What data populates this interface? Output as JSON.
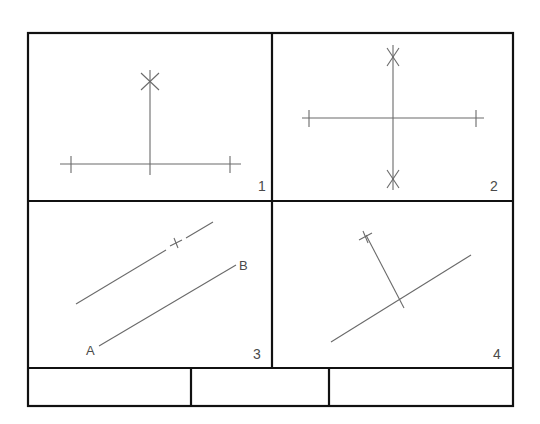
{
  "sheet": {
    "title": "Geometric construction exercises",
    "panels": [
      {
        "number": "1",
        "description": "Perpendicular erected at midpoint of horizontal line"
      },
      {
        "number": "2",
        "description": "Perpendicular bisector of horizontal line"
      },
      {
        "number": "3",
        "description": "Line parallel to AB",
        "labels": {
          "a": "A",
          "b": "B"
        }
      },
      {
        "number": "4",
        "description": "Perpendicular to an inclined line"
      }
    ],
    "title_block": {
      "cells": [
        "",
        "",
        ""
      ]
    }
  },
  "colors": {
    "frame": "#111111",
    "construction": "#6a6a6a",
    "label": "#4a4a4a",
    "background": "#ffffff"
  }
}
